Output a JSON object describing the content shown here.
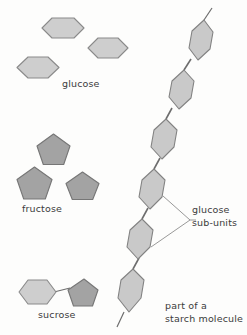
{
  "diagram": {
    "background_color": "#fdfdfc",
    "labels": {
      "glucose": "glucose",
      "fructose": "fructose",
      "sucrose": "sucrose",
      "glucose_subunits_line1": "glucose",
      "glucose_subunits_line2": "sub-units",
      "starch_line1": "part of a",
      "starch_line2": "starch molecule"
    },
    "colors": {
      "hexagon_fill": "#cecece",
      "hexagon_stroke": "#8a8a8a",
      "pentagon_fill": "#a3a3a3",
      "pentagon_stroke": "#767676",
      "chain_hexagon_fill": "#c9c9c9",
      "chain_hexagon_stroke": "#828282",
      "bond_stroke": "#6d6d6d",
      "leader_stroke": "#8c8c8c",
      "text": "#3b3b3b"
    },
    "groups": {
      "glucose": {
        "name": "glucose monomers",
        "shape": "hexagon",
        "count": 3,
        "shade": "light"
      },
      "fructose": {
        "name": "fructose monomers",
        "shape": "pentagon",
        "count": 3,
        "shade": "dark"
      },
      "sucrose": {
        "name": "sucrose disaccharide",
        "shapes": [
          "hexagon",
          "pentagon"
        ],
        "count": 2,
        "bonded": true
      },
      "starch": {
        "name": "starch polymer chain",
        "shape": "hexagon",
        "count": 6,
        "shade": "light",
        "bonded": true,
        "open_ends": 2
      }
    }
  }
}
